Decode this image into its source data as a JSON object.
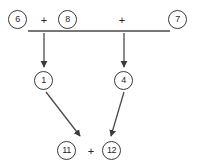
{
  "diagram": {
    "type": "arithmetic-derivation-diagram",
    "background_color": "#ffffff",
    "stroke_color": "#3a3a3a",
    "text_color": "#262626",
    "rows": {
      "top": {
        "name": "operand-row",
        "items": [
          {
            "kind": "circled-number",
            "label": "6",
            "x": 8,
            "y": 10
          },
          {
            "kind": "operator",
            "label": "+",
            "x": 38,
            "y": 15
          },
          {
            "kind": "circled-number",
            "label": "8",
            "x": 58,
            "y": 10
          },
          {
            "kind": "operator",
            "label": "+",
            "x": 116,
            "y": 15
          },
          {
            "kind": "circled-number",
            "label": "7",
            "x": 168,
            "y": 10
          }
        ]
      },
      "middle": {
        "name": "intermediate-row",
        "items": [
          {
            "kind": "circled-number",
            "label": "1",
            "x": 34,
            "y": 71
          },
          {
            "kind": "circled-number",
            "label": "4",
            "x": 114,
            "y": 71
          }
        ]
      },
      "bottom": {
        "name": "result-row",
        "items": [
          {
            "kind": "circled-number",
            "label": "11",
            "x": 57,
            "y": 141
          },
          {
            "kind": "operator",
            "label": "+",
            "x": 85,
            "y": 146
          },
          {
            "kind": "circled-number",
            "label": "12",
            "x": 102,
            "y": 141
          }
        ]
      }
    },
    "rule_line": {
      "name": "horizontal-rule",
      "x1": 28,
      "y1": 31,
      "x2": 170,
      "y2": 31
    },
    "arrows": [
      {
        "name": "arrow-down-left",
        "x1": 44,
        "y1": 33,
        "x2": 44,
        "y2": 67
      },
      {
        "name": "arrow-down-right",
        "x1": 124,
        "y1": 33,
        "x2": 124,
        "y2": 67
      },
      {
        "name": "arrow-diagonal-left",
        "x1": 46,
        "y1": 92,
        "x2": 81,
        "y2": 137
      },
      {
        "name": "arrow-diagonal-right",
        "x1": 124,
        "y1": 92,
        "x2": 110,
        "y2": 137
      }
    ]
  }
}
